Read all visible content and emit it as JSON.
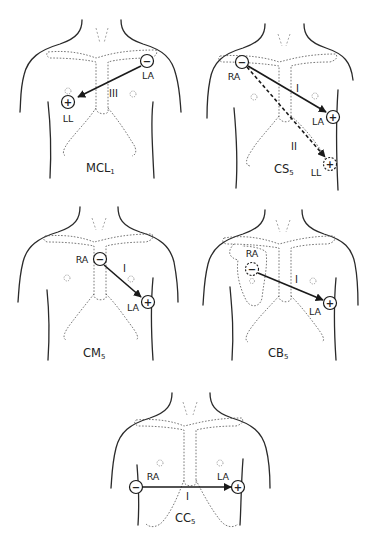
{
  "figure": {
    "panels": [
      {
        "id": "mcl1",
        "title": "MCL",
        "title_sub": "1",
        "lead": "III",
        "negative_electrode": "LA",
        "positive_electrode": "LL",
        "negative_sign": "−",
        "positive_sign": "+"
      },
      {
        "id": "cs5",
        "title": "CS",
        "title_sub": "5",
        "leads": [
          "I",
          "II"
        ],
        "negative_electrode": "RA",
        "positive_electrodes": [
          "LA",
          "LL"
        ],
        "negative_sign": "−",
        "positive_sign": "+"
      },
      {
        "id": "cm5",
        "title": "CM",
        "title_sub": "5",
        "lead": "I",
        "negative_electrode": "RA",
        "positive_electrode": "LA",
        "negative_sign": "−",
        "positive_sign": "+"
      },
      {
        "id": "cb5",
        "title": "CB",
        "title_sub": "5",
        "lead": "I",
        "negative_electrode": "RA",
        "positive_electrode": "LA",
        "negative_sign": "−",
        "positive_sign": "+"
      },
      {
        "id": "cc5",
        "title": "CC",
        "title_sub": "5",
        "lead": "I",
        "negative_electrode": "RA",
        "positive_electrode": "LA",
        "negative_sign": "−",
        "positive_sign": "+"
      }
    ]
  }
}
